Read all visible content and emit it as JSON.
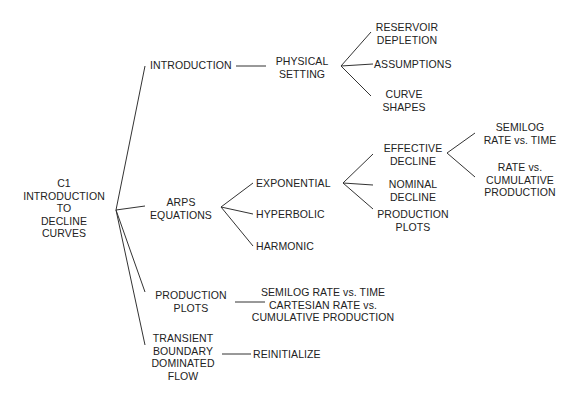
{
  "diagram": {
    "type": "tree",
    "root": {
      "id": "root",
      "lines": [
        "C1",
        "INTRODUCTION",
        "TO",
        "DECLINE",
        "CURVES"
      ]
    },
    "nodes": {
      "introduction": {
        "lines": [
          "INTRODUCTION"
        ]
      },
      "physical_setting": {
        "lines": [
          "PHYSICAL",
          "SETTING"
        ]
      },
      "reservoir_depletion": {
        "lines": [
          "RESERVOIR",
          "DEPLETION"
        ]
      },
      "assumptions": {
        "lines": [
          "ASSUMPTIONS"
        ]
      },
      "curve_shapes": {
        "lines": [
          "CURVE",
          "SHAPES"
        ]
      },
      "arps_equations": {
        "lines": [
          "ARPS",
          "EQUATIONS"
        ]
      },
      "exponential": {
        "lines": [
          "EXPONENTIAL"
        ]
      },
      "hyperbolic": {
        "lines": [
          "HYPERBOLIC"
        ]
      },
      "harmonic": {
        "lines": [
          "HARMONIC"
        ]
      },
      "effective_decline": {
        "lines": [
          "EFFECTIVE",
          "DECLINE"
        ]
      },
      "nominal_decline": {
        "lines": [
          "NOMINAL",
          "DECLINE"
        ]
      },
      "production_plots_exp": {
        "lines": [
          "PRODUCTION",
          "PLOTS"
        ]
      },
      "semilog_rate_time": {
        "lines": [
          "SEMILOG",
          "RATE vs. TIME"
        ]
      },
      "rate_vs_cumulative": {
        "lines": [
          "RATE vs.",
          "CUMULATIVE",
          "PRODUCTION"
        ]
      },
      "production_plots": {
        "lines": [
          "PRODUCTION",
          "PLOTS"
        ]
      },
      "production_plots_detail": {
        "lines": [
          "SEMILOG RATE vs. TIME",
          "CARTESIAN RATE vs.",
          "CUMULATIVE PRODUCTION"
        ]
      },
      "transient": {
        "lines": [
          "TRANSIENT",
          "BOUNDARY",
          "DOMINATED",
          "FLOW"
        ]
      },
      "reinitialize": {
        "lines": [
          "REINITIALIZE"
        ]
      }
    },
    "edges": [
      [
        "root",
        "introduction"
      ],
      [
        "root",
        "arps_equations"
      ],
      [
        "root",
        "production_plots"
      ],
      [
        "root",
        "transient"
      ],
      [
        "introduction",
        "physical_setting"
      ],
      [
        "physical_setting",
        "reservoir_depletion"
      ],
      [
        "physical_setting",
        "assumptions"
      ],
      [
        "physical_setting",
        "curve_shapes"
      ],
      [
        "arps_equations",
        "exponential"
      ],
      [
        "arps_equations",
        "hyperbolic"
      ],
      [
        "arps_equations",
        "harmonic"
      ],
      [
        "exponential",
        "effective_decline"
      ],
      [
        "exponential",
        "nominal_decline"
      ],
      [
        "exponential",
        "production_plots_exp"
      ],
      [
        "effective_decline",
        "semilog_rate_time"
      ],
      [
        "effective_decline",
        "rate_vs_cumulative"
      ],
      [
        "production_plots",
        "production_plots_detail"
      ],
      [
        "transient",
        "reinitialize"
      ]
    ],
    "colors": {
      "line": "#333333",
      "text": "#222222",
      "background": "#ffffff"
    }
  }
}
